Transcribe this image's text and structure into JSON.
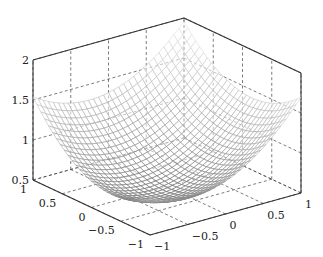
{
  "chart_data": {
    "type": "surface",
    "title": "",
    "xlabel": "",
    "ylabel": "",
    "zlabel": "",
    "grid": true,
    "legend": null,
    "surface_function": "z = 0.7 + 0.29*x + 0.21*y - 0.08*x*y + 0.42*(x^2 + y^2)",
    "x_range": [
      -1,
      1
    ],
    "y_range": [
      -1,
      1
    ],
    "zlim": [
      0.5,
      2
    ],
    "mesh_resolution": 31,
    "x_ticks": [
      "-1",
      "-0.5",
      "0",
      "0.5",
      "1"
    ],
    "y_ticks": [
      "-1",
      "-0.5",
      "0",
      "0.5",
      "1"
    ],
    "z_ticks": [
      "0.5",
      "1",
      "1.5",
      "2"
    ],
    "corner_values": {
      "x=-1,y=-1": 0.95,
      "x=1,y=-1": 1.69,
      "x=-1,y=1": 1.54,
      "x=1,y=1": 1.95,
      "x=0,y=0": 0.7
    },
    "colormap": "grayscale mesh, dark at minimum, light at edges"
  },
  "colors": {
    "axis": "#333333",
    "grid": "#444444",
    "mesh_dark": "#555555",
    "mesh_light": "#e6e6e6"
  }
}
